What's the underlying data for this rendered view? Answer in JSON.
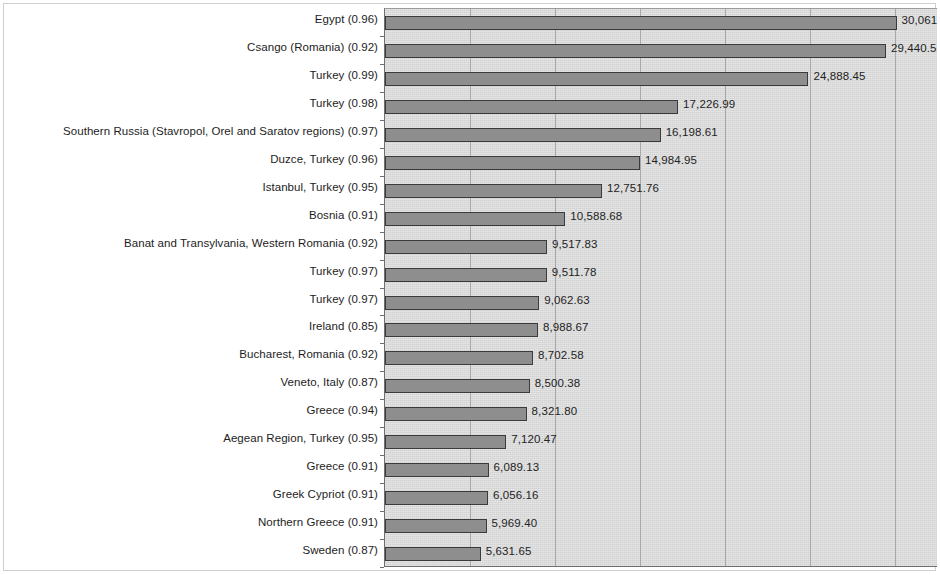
{
  "chart_data": {
    "type": "bar",
    "orientation": "horizontal",
    "title": "",
    "subtitle": "",
    "xlabel": "",
    "ylabel": "",
    "grid": true,
    "legend": false,
    "xlim": [
      0,
      32500
    ],
    "gridline_values": [
      5000,
      10000,
      15000,
      20000,
      25000,
      30000
    ],
    "value_format": "#,##0.00",
    "categories": [
      "Egypt (0.96)",
      "Csango (Romania) (0.92)",
      "Turkey (0.99)",
      "Turkey (0.98)",
      "Southern Russia (Stavropol, Orel and Saratov regions) (0.97)",
      "Duzce, Turkey (0.96)",
      "Istanbul, Turkey (0.95)",
      "Bosnia (0.91)",
      "Banat and Transylvania, Western Romania (0.92)",
      "Turkey (0.97)",
      "Turkey (0.97)",
      "Ireland (0.85)",
      "Bucharest, Romania (0.92)",
      "Veneto, Italy (0.87)",
      "Greece (0.94)",
      "Aegean Region, Turkey (0.95)",
      "Greece (0.91)",
      "Greek Cypriot (0.91)",
      "Northern Greece (0.91)",
      "Sweden (0.87)"
    ],
    "values": [
      30061.6,
      29440.52,
      24888.45,
      17226.99,
      16198.61,
      14984.95,
      12751.76,
      10588.68,
      9517.83,
      9511.78,
      9062.63,
      8988.67,
      8702.58,
      8500.38,
      8321.8,
      7120.47,
      6089.13,
      6056.16,
      5969.4,
      5631.65
    ],
    "value_labels": [
      "30,061.60",
      "29,440.52",
      "24,888.45",
      "17,226.99",
      "16,198.61",
      "14,984.95",
      "12,751.76",
      "10,588.68",
      "9,517.83",
      "9,511.78",
      "9,062.63",
      "8,988.67",
      "8,702.58",
      "8,500.38",
      "8,321.80",
      "7,120.47",
      "6,089.13",
      "6,056.16",
      "5,969.40",
      "5,631.65"
    ],
    "colors": {
      "bar_fill": "#8e8e8e",
      "bar_border": "#3b3b3b",
      "plot_background": "#d9d9d9",
      "gridline": "#a8a8a8",
      "axis": "#6e6e6e",
      "text": "#1d1d1d",
      "page_background": "#ffffff"
    }
  }
}
